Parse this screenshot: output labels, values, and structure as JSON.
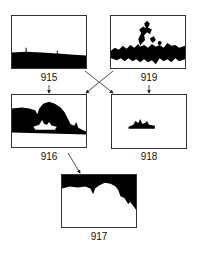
{
  "diagram": {
    "panels": [
      {
        "id": "915",
        "label": "915",
        "content": "horizon-silhouette"
      },
      {
        "id": "919",
        "label": "919",
        "content": "foliage-texture"
      },
      {
        "id": "916",
        "label": "916",
        "content": "trees-and-boat-silhouette"
      },
      {
        "id": "918",
        "label": "918",
        "content": "boat-silhouette"
      },
      {
        "id": "917",
        "label": "917",
        "content": "inverted-canopy-silhouette"
      }
    ],
    "arrows": [
      {
        "from": "915",
        "to": "916"
      },
      {
        "from": "915",
        "to": "918"
      },
      {
        "from": "919",
        "to": "916"
      },
      {
        "from": "919",
        "to": "918"
      },
      {
        "from": "916",
        "to": "917"
      }
    ]
  }
}
